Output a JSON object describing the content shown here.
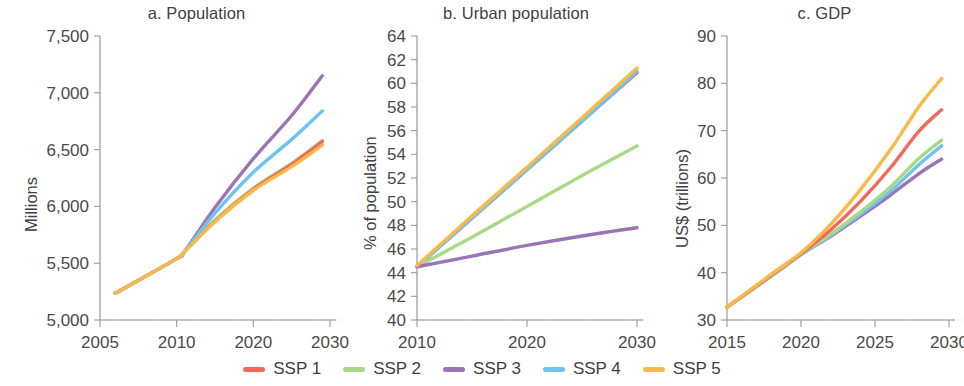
{
  "figure": {
    "background_color": "#ffffff",
    "axis_color": "#8d8d8d",
    "text_color": "#3f3f3f"
  },
  "legend": {
    "position": "bottom-center",
    "items": [
      {
        "label": "SSP 1",
        "color": "#F4675A"
      },
      {
        "label": "SSP 2",
        "color": "#A8D888"
      },
      {
        "label": "SSP 3",
        "color": "#9A74B5"
      },
      {
        "label": "SSP 4",
        "color": "#6FC3F0"
      },
      {
        "label": "SSP 5",
        "color": "#F9B949"
      }
    ]
  },
  "panels": {
    "a": {
      "title": "a. Population",
      "ylabel": "Millions"
    },
    "b": {
      "title": "b. Urban population",
      "ylabel": "% of population"
    },
    "c": {
      "title": "c. GDP",
      "ylabel": "US$ (trillions)"
    }
  },
  "chart_data": [
    {
      "id": "a",
      "type": "line",
      "title": "a. Population",
      "xlabel": "",
      "ylabel": "Millions",
      "xlim": [
        2005,
        2030
      ],
      "ylim": [
        5000,
        7500
      ],
      "yticks": [
        5000,
        5500,
        6000,
        6500,
        7000,
        7500
      ],
      "ytick_labels": [
        "5,000",
        "5,500",
        "6,000",
        "6,500",
        "7,000",
        "7,500"
      ],
      "xticks": [
        2005,
        2010,
        2020,
        2030
      ],
      "xtick_labels": [
        "2005",
        "2010",
        "2020",
        "2030"
      ],
      "grid": false,
      "x": [
        2006,
        2010,
        2011,
        2015,
        2020,
        2025,
        2029
      ],
      "series": [
        {
          "name": "SSP 1",
          "color": "#F4675A",
          "values": [
            5235,
            5540,
            5600,
            5870,
            6150,
            6370,
            6570
          ]
        },
        {
          "name": "SSP 2",
          "color": "#A8D888",
          "values": [
            5235,
            5540,
            5600,
            5880,
            6160,
            6380,
            6580
          ]
        },
        {
          "name": "SSP 3",
          "color": "#9A74B5",
          "values": [
            5235,
            5540,
            5600,
            5990,
            6420,
            6800,
            7150
          ]
        },
        {
          "name": "SSP 4",
          "color": "#6FC3F0",
          "values": [
            5235,
            5540,
            5600,
            5940,
            6300,
            6590,
            6840
          ]
        },
        {
          "name": "SSP 5",
          "color": "#F9B949",
          "values": [
            5235,
            5540,
            5600,
            5865,
            6140,
            6350,
            6540
          ]
        }
      ]
    },
    {
      "id": "b",
      "type": "line",
      "title": "b. Urban population",
      "xlabel": "",
      "ylabel": "% of population",
      "xlim": [
        2010,
        2030
      ],
      "ylim": [
        40,
        64
      ],
      "yticks": [
        40,
        42,
        44,
        46,
        48,
        50,
        52,
        54,
        56,
        58,
        60,
        62,
        64
      ],
      "ytick_labels": [
        "40",
        "42",
        "44",
        "46",
        "48",
        "50",
        "52",
        "54",
        "56",
        "58",
        "60",
        "62",
        "64"
      ],
      "xticks": [
        2010,
        2020,
        2030
      ],
      "xtick_labels": [
        "2010",
        "2020",
        "2030"
      ],
      "grid": false,
      "x": [
        2010,
        2015,
        2020,
        2025,
        2030
      ],
      "series": [
        {
          "name": "SSP 1",
          "color": "#F4675A",
          "values": [
            44.5,
            48.6,
            52.7,
            56.8,
            60.9
          ]
        },
        {
          "name": "SSP 2",
          "color": "#A8D888",
          "values": [
            44.5,
            47.0,
            49.6,
            52.2,
            54.7
          ]
        },
        {
          "name": "SSP 3",
          "color": "#9A74B5",
          "values": [
            44.5,
            45.4,
            46.3,
            47.1,
            47.8
          ]
        },
        {
          "name": "SSP 4",
          "color": "#6FC3F0",
          "values": [
            44.5,
            48.6,
            52.7,
            56.8,
            61.0
          ]
        },
        {
          "name": "SSP 5",
          "color": "#F9B949",
          "values": [
            44.6,
            48.8,
            52.9,
            57.1,
            61.3
          ]
        }
      ]
    },
    {
      "id": "c",
      "type": "line",
      "title": "c. GDP",
      "xlabel": "",
      "ylabel": "US$ (trillions)",
      "xlim": [
        2015,
        2030
      ],
      "ylim": [
        30,
        90
      ],
      "yticks": [
        30,
        40,
        50,
        60,
        70,
        80,
        90
      ],
      "ytick_labels": [
        "30",
        "40",
        "50",
        "60",
        "70",
        "80",
        "90"
      ],
      "xticks": [
        2015,
        2020,
        2025,
        2030
      ],
      "xtick_labels": [
        "2015",
        "2020",
        "2025",
        "2030"
      ],
      "grid": false,
      "x": [
        2015,
        2018,
        2020,
        2022,
        2024,
        2026,
        2028,
        2029.5
      ],
      "series": [
        {
          "name": "SSP 1",
          "color": "#F4675A",
          "values": [
            32.7,
            39.5,
            44.0,
            49.0,
            55.0,
            62.0,
            70.0,
            74.4
          ]
        },
        {
          "name": "SSP 2",
          "color": "#A8D888",
          "values": [
            32.7,
            39.4,
            43.9,
            48.1,
            52.8,
            58.0,
            64.2,
            68.0
          ]
        },
        {
          "name": "SSP 3",
          "color": "#9A74B5",
          "values": [
            32.7,
            39.3,
            43.8,
            47.7,
            51.9,
            56.3,
            61.0,
            64.0
          ]
        },
        {
          "name": "SSP 4",
          "color": "#6FC3F0",
          "values": [
            32.7,
            39.3,
            43.8,
            47.9,
            52.3,
            57.1,
            62.9,
            66.8
          ]
        },
        {
          "name": "SSP 5",
          "color": "#F9B949",
          "values": [
            32.7,
            39.7,
            44.2,
            50.2,
            57.5,
            65.8,
            75.2,
            81.0
          ]
        }
      ]
    }
  ]
}
